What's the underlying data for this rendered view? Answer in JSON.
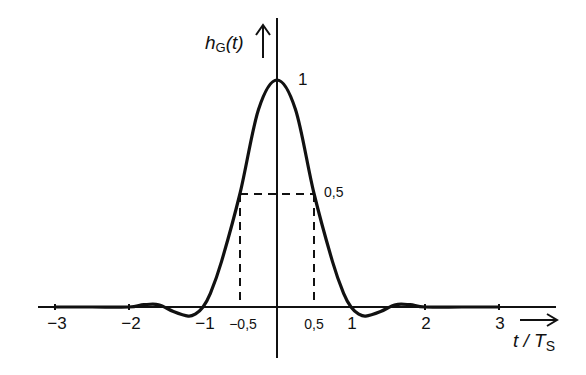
{
  "chart_data": {
    "type": "line",
    "title": "",
    "ylabel": "h_G(t)",
    "ylabel_main": "h",
    "ylabel_sub": "G",
    "ylabel_arg": "(t)",
    "xlabel": "t / T_S",
    "xlabel_main": "t / T",
    "xlabel_sub": "S",
    "xlim": [
      -3.3,
      3.7
    ],
    "ylim": [
      -0.1,
      1.15
    ],
    "grid": false,
    "legend": null,
    "x_ticks": [
      {
        "value": -3,
        "label": "−3"
      },
      {
        "value": -2,
        "label": "−2"
      },
      {
        "value": -1,
        "label": "−1"
      },
      {
        "value": -0.5,
        "label": "−0,5"
      },
      {
        "value": 0.5,
        "label": "0,5"
      },
      {
        "value": 1,
        "label": "1"
      },
      {
        "value": 2,
        "label": "2"
      },
      {
        "value": 3,
        "label": "3"
      }
    ],
    "annotations": [
      {
        "text": "1",
        "x": 0,
        "y": 1,
        "meaning": "peak value"
      },
      {
        "text": "0,5",
        "x": 0.5,
        "y": 0.5,
        "meaning": "half-amplitude level (dashed guide lines at t/Ts = ±0.5)"
      }
    ],
    "series": [
      {
        "name": "h_G(t)",
        "x": [
          -3,
          -2.5,
          -2,
          -1.8,
          -1.6,
          -1.4,
          -1.2,
          -1.1,
          -1,
          -0.9,
          -0.75,
          -0.5,
          -0.25,
          0,
          0.25,
          0.5,
          0.75,
          0.9,
          1,
          1.1,
          1.2,
          1.4,
          1.6,
          1.8,
          2,
          2.5,
          3
        ],
        "values": [
          0,
          0,
          0.0,
          0.01,
          0.01,
          -0.02,
          -0.04,
          -0.03,
          0,
          0.06,
          0.2,
          0.5,
          0.87,
          1.0,
          0.87,
          0.5,
          0.2,
          0.06,
          0,
          -0.03,
          -0.04,
          -0.02,
          0.01,
          0.01,
          0.0,
          0,
          0
        ]
      }
    ],
    "dashed_guides": [
      {
        "from": [
          -0.5,
          0
        ],
        "to": [
          -0.5,
          0.5
        ]
      },
      {
        "from": [
          0.5,
          0
        ],
        "to": [
          0.5,
          0.5
        ]
      },
      {
        "from": [
          -0.5,
          0.5
        ],
        "to": [
          0.5,
          0.5
        ]
      }
    ]
  },
  "labels": {
    "peak": "1",
    "half": "0,5",
    "y_main": "h",
    "y_sub": "G",
    "y_arg": "(t)",
    "x_main": "t / T",
    "x_sub": "S",
    "ticks": [
      "−3",
      "−2",
      "−1",
      "−0,5",
      "0,5",
      "1",
      "2",
      "3"
    ]
  },
  "colors": {
    "ink": "#111111",
    "background": "#ffffff"
  }
}
